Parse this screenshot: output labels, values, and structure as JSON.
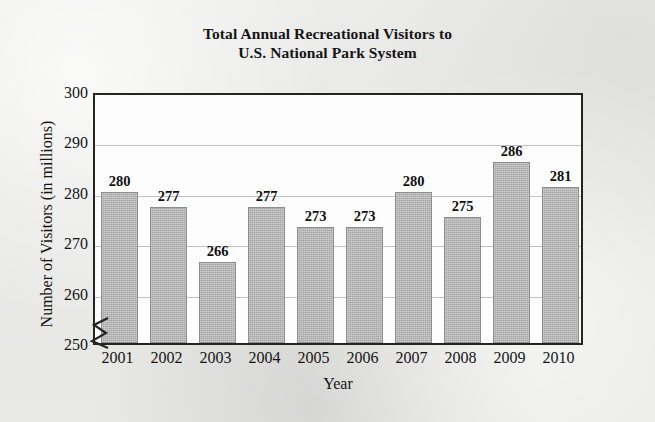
{
  "figure": {
    "title_line1": "Total Annual Recreational Visitors to",
    "title_line2": "U.S. National Park System",
    "background_color": "#e9e9e7",
    "plot_background_color": "#fdfdfd",
    "frame_color": "#242424",
    "bar_color": "#a3a3a3",
    "bar_edge_color": "#8d8d8d",
    "gridline_color": "#c2c2c2",
    "axis_break_symbol": "zigzag-break-icon"
  },
  "chart_data": {
    "type": "bar",
    "title": "Total Annual Recreational Visitors to U.S. National Park System",
    "xlabel": "Year",
    "ylabel": "Number of Visitors (in millions)",
    "categories": [
      "2001",
      "2002",
      "2003",
      "2004",
      "2005",
      "2006",
      "2007",
      "2008",
      "2009",
      "2010"
    ],
    "values": [
      280,
      277,
      266,
      277,
      273,
      273,
      280,
      275,
      286,
      281
    ],
    "value_labels": [
      "280",
      "277",
      "266",
      "277",
      "273",
      "273",
      "280",
      "275",
      "286",
      "281"
    ],
    "ylim": [
      250,
      300
    ],
    "yticks": [
      250,
      260,
      270,
      280,
      290,
      300
    ],
    "ytick_labels": [
      "250",
      "260",
      "270",
      "280",
      "290",
      "300"
    ],
    "grid": true,
    "grid_axis": "y",
    "legend": false,
    "axis_break": true,
    "axis_break_note": "y-axis broken below 250"
  }
}
